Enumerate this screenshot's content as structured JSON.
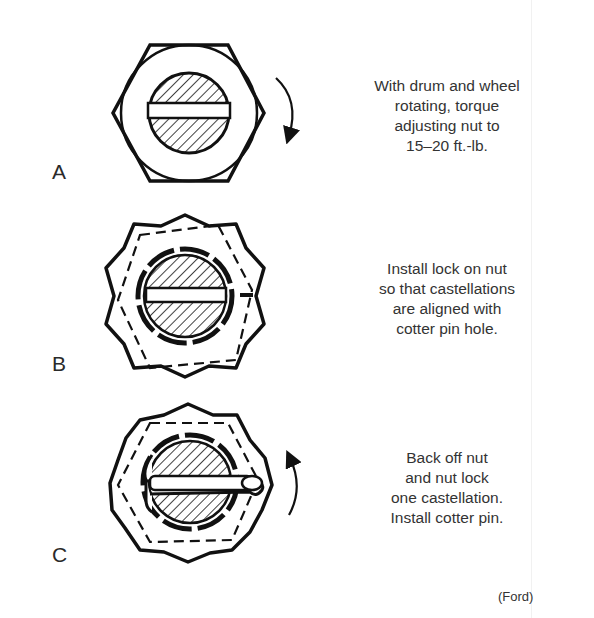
{
  "figure": {
    "steps": [
      {
        "label": "A",
        "caption_lines": [
          "With drum and wheel",
          "rotating, torque",
          "adjusting nut to",
          "15–20 ft.-lb."
        ],
        "graphic": "hex-nut-with-spindle",
        "arrow": "clockwise"
      },
      {
        "label": "B",
        "caption_lines": [
          "Install lock on nut",
          "so that castellations",
          "are aligned with",
          "cotter pin hole."
        ],
        "graphic": "castellated-nut-lock",
        "arrow": "none"
      },
      {
        "label": "C",
        "caption_lines": [
          "Back off nut",
          "and nut lock",
          "one castellation.",
          "Install cotter pin."
        ],
        "graphic": "nut-lock-with-cotter-pin",
        "arrow": "counterclockwise"
      }
    ],
    "credit": "(Ford)"
  },
  "colors": {
    "ink": "#111111",
    "text": "#333333",
    "background": "#ffffff"
  }
}
